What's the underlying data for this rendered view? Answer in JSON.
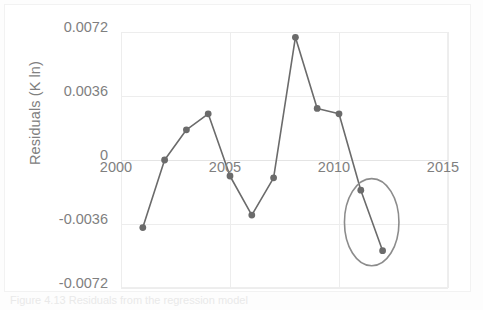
{
  "figure": {
    "caption": "Figure 4.13  Residuals from the regression model",
    "accent_color": "#6b6b6b",
    "grid_color": "#ededed",
    "text_color": "#7f7f7f"
  },
  "chart_data": {
    "type": "line",
    "title": "",
    "xlabel": "",
    "ylabel": "Residuals (K ln)",
    "xlim": [
      2000,
      2015
    ],
    "ylim": [
      -0.0072,
      0.0072
    ],
    "grid": true,
    "legend": "none",
    "xticks": [
      "2000",
      "2005",
      "2010",
      "2015"
    ],
    "xtick_values": [
      2000,
      2005,
      2010,
      2015
    ],
    "yticks": [
      "0.0072",
      "0.0036",
      "0",
      "-0.0036",
      "-0.0072"
    ],
    "ytick_values": [
      0.0072,
      0.0036,
      0,
      -0.0036,
      -0.0072
    ],
    "series": [
      {
        "name": "Residuals",
        "color": "#6b6b6b",
        "marker": "circle",
        "x": [
          2001,
          2002,
          2003,
          2004,
          2005,
          2006,
          2007,
          2008,
          2009,
          2010,
          2011,
          2012
        ],
        "y": [
          -0.0038,
          0.0,
          0.0017,
          0.0026,
          -0.0009,
          -0.0031,
          -0.001,
          0.0069,
          0.0029,
          0.0026,
          -0.0017,
          -0.0051
        ]
      }
    ],
    "annotations": [
      {
        "type": "ellipse",
        "name": "highlight-ellipse",
        "color": "#8c8c8c",
        "center_x": 2011.5,
        "center_y": -0.0035,
        "radius_x_years": 1.25,
        "radius_y_value": 0.00245
      }
    ]
  }
}
